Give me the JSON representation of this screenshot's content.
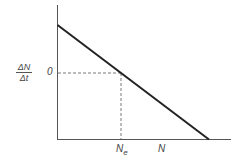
{
  "diagram": {
    "y_axis_label_numerator": "ΔN",
    "y_axis_label_denominator": "Δt",
    "y_zero_label": "0",
    "x_marker_label": "N",
    "x_marker_subscript": "e",
    "x_axis_label": "N",
    "line_color": "#222222",
    "axis_color": "#555555"
  }
}
